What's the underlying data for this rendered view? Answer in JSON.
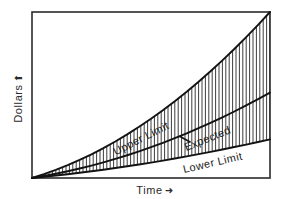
{
  "chart_data": {
    "type": "line",
    "title": "",
    "subtitle": "",
    "xlabel": "Time",
    "ylabel": "Dollars",
    "xlabel_arrow": "➜",
    "ylabel_arrow": "⬆",
    "grid": false,
    "legend_position": "inline-curve-labels",
    "axis_style": "box-frame",
    "xlim": [
      0,
      100
    ],
    "ylim": [
      0,
      100
    ],
    "xticks": [],
    "yticks": [],
    "fill_between": {
      "upper_series": "Upper Limit",
      "lower_series": "Lower Limit",
      "pattern": "vertical-hatch",
      "hatch_spacing_px": 3.4,
      "hatch_color": "#1a1a1a"
    },
    "x": [
      0,
      5,
      10,
      15,
      20,
      25,
      30,
      35,
      40,
      45,
      50,
      55,
      60,
      65,
      70,
      75,
      80,
      85,
      90,
      95,
      100
    ],
    "series": [
      {
        "name": "Upper Limit",
        "label": "Upper Limit",
        "label_rotation_deg": -27,
        "color": "#121212",
        "values": [
          0,
          3.2,
          6.8,
          10.8,
          15.2,
          20.0,
          25.2,
          30.8,
          36.8,
          43.2,
          50.0,
          57.2,
          64.8,
          72.8,
          81.2,
          90.0,
          99.2,
          108.8,
          118.8,
          129.2,
          140.0
        ]
      },
      {
        "name": "Expected",
        "label": "Expected",
        "label_rotation_deg": -22,
        "color": "#121212",
        "values": [
          0,
          1.7,
          3.6,
          5.7,
          8.0,
          10.5,
          13.2,
          16.1,
          19.2,
          22.5,
          26.0,
          29.7,
          33.6,
          37.7,
          42.0,
          46.5,
          51.2,
          56.1,
          61.2,
          66.5,
          72.0
        ]
      },
      {
        "name": "Lower Limit",
        "label": "Lower Limit",
        "label_rotation_deg": -13,
        "color": "#121212",
        "values": [
          0,
          1.0,
          2.1,
          3.2,
          4.4,
          5.7,
          7.0,
          8.4,
          9.9,
          11.4,
          13.0,
          14.7,
          16.4,
          18.2,
          20.1,
          22.0,
          24.0,
          26.1,
          28.2,
          30.4,
          32.6
        ]
      }
    ]
  },
  "axes": {
    "ylabel_text": "Dollars",
    "ylabel_arrow": "⬆",
    "xlabel_text": "Time",
    "xlabel_arrow": "➜"
  },
  "curve_labels": {
    "upper": "Upper Limit",
    "expected": "Expected",
    "lower": "Lower Limit"
  },
  "colors": {
    "background": "#ffffff",
    "frame": "#2b2b2b",
    "curve": "#121212",
    "hatch": "#1f1f1f",
    "text": "#2b2b2b"
  }
}
